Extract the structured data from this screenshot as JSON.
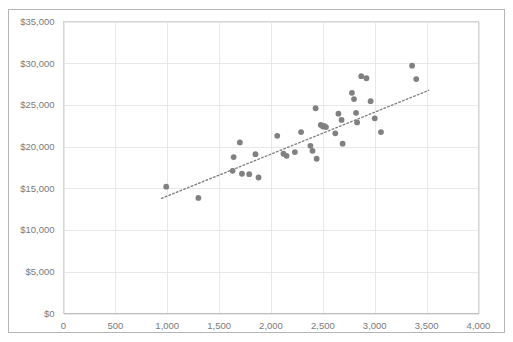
{
  "chart_data": {
    "type": "scatter",
    "title": "",
    "xlabel": "",
    "ylabel": "",
    "xlim": [
      0,
      4000
    ],
    "ylim": [
      0,
      35000
    ],
    "grid": true,
    "legend": "none",
    "x_ticks": [
      "0",
      "500",
      "1,000",
      "1,500",
      "2,000",
      "2,500",
      "3,000",
      "3,500",
      "4,000"
    ],
    "x_tick_values": [
      0,
      500,
      1000,
      1500,
      2000,
      2500,
      3000,
      3500,
      4000
    ],
    "y_ticks": [
      "$0",
      "$5,000",
      "$10,000",
      "$15,000",
      "$20,000",
      "$25,000",
      "$30,000",
      "$35,000"
    ],
    "y_tick_values": [
      0,
      5000,
      10000,
      15000,
      20000,
      25000,
      30000,
      35000
    ],
    "marker_color": "#808080",
    "trendline_color": "#808080",
    "trendline_style": "dotted",
    "gridline_color": "#e8e8e8",
    "series": [
      {
        "name": "observations",
        "points": [
          [
            990,
            15200
          ],
          [
            1300,
            13850
          ],
          [
            1630,
            17100
          ],
          [
            1640,
            18750
          ],
          [
            1700,
            20500
          ],
          [
            1720,
            16750
          ],
          [
            1790,
            16700
          ],
          [
            1850,
            19100
          ],
          [
            1880,
            16300
          ],
          [
            2060,
            21300
          ],
          [
            2120,
            19150
          ],
          [
            2150,
            18900
          ],
          [
            2230,
            19350
          ],
          [
            2290,
            21750
          ],
          [
            2380,
            20100
          ],
          [
            2400,
            19500
          ],
          [
            2430,
            24600
          ],
          [
            2440,
            18550
          ],
          [
            2480,
            22600
          ],
          [
            2500,
            22400
          ],
          [
            2510,
            22500
          ],
          [
            2530,
            22350
          ],
          [
            2620,
            21600
          ],
          [
            2650,
            23950
          ],
          [
            2680,
            23200
          ],
          [
            2690,
            20350
          ],
          [
            2780,
            26450
          ],
          [
            2800,
            25700
          ],
          [
            2820,
            24050
          ],
          [
            2830,
            22900
          ],
          [
            2870,
            28450
          ],
          [
            2920,
            28200
          ],
          [
            2960,
            25450
          ],
          [
            3000,
            23400
          ],
          [
            3060,
            21750
          ],
          [
            3360,
            29700
          ],
          [
            3400,
            28100
          ]
        ]
      }
    ],
    "trendline": {
      "x0": 945,
      "y0": 13800,
      "x1": 3520,
      "y1": 26750
    }
  }
}
